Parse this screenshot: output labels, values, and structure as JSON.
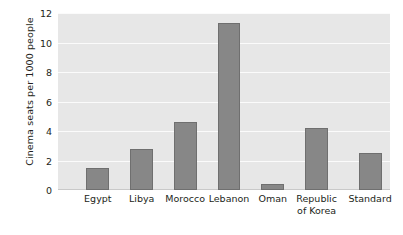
{
  "chart_data": {
    "type": "bar",
    "title": "",
    "xlabel": "",
    "ylabel": "Cinema seats per 1000 people",
    "categories": [
      "Egypt",
      "Libya",
      "Morocco",
      "Lebanon",
      "Oman",
      "Republic\nof Korea",
      "Standard"
    ],
    "values": [
      1.5,
      2.8,
      4.6,
      11.3,
      0.4,
      4.2,
      2.5
    ],
    "ylim": [
      0,
      12
    ],
    "yticks": [
      0,
      2,
      4,
      6,
      8,
      10,
      12
    ],
    "ytick_labels": [
      "0",
      "2",
      "4",
      "6",
      "8",
      "10",
      "12"
    ],
    "grid": true,
    "grid_axis": "y",
    "legend": false,
    "bar_color": "#878787",
    "bar_border_color": "#6f6f6f",
    "plot_background": "#e7e7e7",
    "gridline_color": "#fbfbfb",
    "text_color": "#231f20",
    "bar_centers_pct": [
      12.0,
      25.2,
      38.3,
      51.5,
      64.7,
      77.9,
      94.0
    ],
    "bar_width_pct": 6.9
  }
}
